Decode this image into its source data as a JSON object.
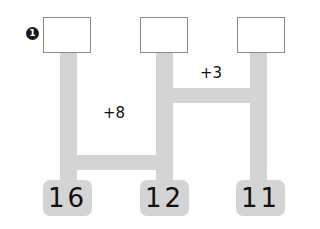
{
  "problem": {
    "number": "1",
    "answer_boxes": [
      "",
      "",
      ""
    ],
    "connectors": [
      {
        "label": "+8",
        "between": [
          1,
          2
        ]
      },
      {
        "label": "+3",
        "between": [
          2,
          3
        ]
      }
    ],
    "start_values": [
      "16",
      "12",
      "11"
    ]
  },
  "colors": {
    "ladder": "#d4d4d4",
    "box_border": "#8a8a8a",
    "text": "#111111"
  }
}
